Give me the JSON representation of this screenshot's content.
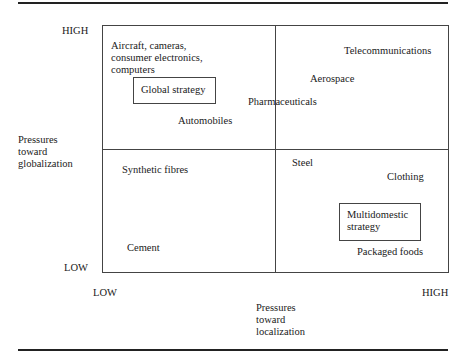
{
  "diagram": {
    "type": "2x2 matrix",
    "y_axis": {
      "label": "Pressures\ntoward\nglobalization",
      "high": "HIGH",
      "low": "LOW"
    },
    "x_axis": {
      "label": "Pressures\ntoward\nlocalization",
      "low": "LOW",
      "high": "HIGH"
    },
    "quadrants": {
      "top_left": {
        "items": [
          "Aircraft, cameras,\nconsumer electronics,\ncomputers",
          "Automobiles"
        ],
        "strategy": "Global strategy"
      },
      "top_right": {
        "items": [
          "Telecommunications",
          "Aerospace",
          "Pharmaceuticals"
        ]
      },
      "bottom_left": {
        "items": [
          "Synthetic fibres",
          "Cement"
        ]
      },
      "bottom_right": {
        "items": [
          "Steel",
          "Clothing",
          "Packaged foods"
        ],
        "strategy": "Multidomestic\nstrategy"
      }
    }
  }
}
